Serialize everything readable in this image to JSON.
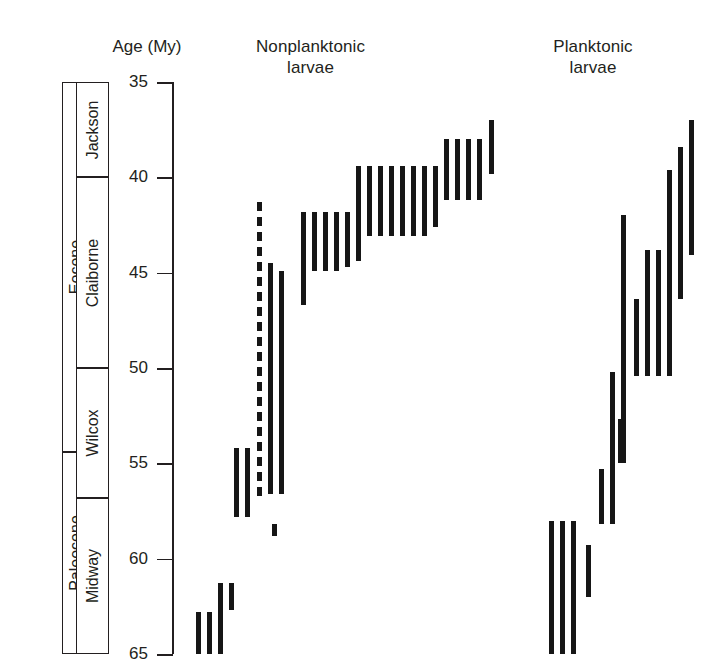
{
  "axis": {
    "title": "Age (My)",
    "unit": "My",
    "min": 35,
    "max": 65,
    "ticks": [
      35,
      40,
      45,
      50,
      55,
      60,
      65
    ],
    "tick_labels": [
      "35",
      "40",
      "45",
      "50",
      "55",
      "60",
      "65"
    ]
  },
  "headers": {
    "nonplanktonic": "Nonplanktonic\nlarvae",
    "planktonic": "Planktonic\nlarvae"
  },
  "stratigraphy": {
    "epochs": [
      {
        "name": "Eocene",
        "top_my": 35.0,
        "bottom_my": 54.4
      },
      {
        "name": "Paleocene",
        "top_my": 54.4,
        "bottom_my": 65.0
      }
    ],
    "stages": [
      {
        "name": "Jackson",
        "top_my": 35.0,
        "bottom_my": 40.0
      },
      {
        "name": "Claiborne",
        "top_my": 40.0,
        "bottom_my": 50.0
      },
      {
        "name": "Wilcox",
        "top_my": 50.0,
        "bottom_my": 56.8
      },
      {
        "name": "Midway",
        "top_my": 56.8,
        "bottom_my": 65.0
      }
    ]
  },
  "chart_data": {
    "type": "range_bar",
    "xlabel": "",
    "ylabel": "Age (My)",
    "ylim": [
      65,
      35
    ],
    "y_inverted": true,
    "grid": false,
    "legend_position": "none",
    "color": "#161616",
    "groups": [
      {
        "name": "Nonplanktonic larvae",
        "ranges": [
          {
            "index": 1,
            "top_my": 62.8,
            "bottom_my": 65.0,
            "style": "solid"
          },
          {
            "index": 2,
            "top_my": 62.8,
            "bottom_my": 65.0,
            "style": "solid"
          },
          {
            "index": 3,
            "top_my": 61.3,
            "bottom_my": 65.0,
            "style": "solid"
          },
          {
            "index": 4,
            "top_my": 61.3,
            "bottom_my": 62.7,
            "style": "solid"
          },
          {
            "index": 5,
            "top_my": 58.2,
            "bottom_my": 58.8,
            "style": "solid"
          },
          {
            "index": 6,
            "top_my": 54.2,
            "bottom_my": 57.8,
            "style": "solid"
          },
          {
            "index": 7,
            "top_my": 54.2,
            "bottom_my": 57.8,
            "style": "solid"
          },
          {
            "index": 8,
            "top_my": 41.3,
            "bottom_my": 56.8,
            "style": "dashed"
          },
          {
            "index": 9,
            "top_my": 44.5,
            "bottom_my": 56.6,
            "style": "solid"
          },
          {
            "index": 10,
            "top_my": 44.9,
            "bottom_my": 56.6,
            "style": "solid"
          },
          {
            "index": 11,
            "top_my": 41.8,
            "bottom_my": 46.7,
            "style": "solid"
          },
          {
            "index": 12,
            "top_my": 41.8,
            "bottom_my": 44.9,
            "style": "solid"
          },
          {
            "index": 13,
            "top_my": 41.8,
            "bottom_my": 44.9,
            "style": "solid"
          },
          {
            "index": 14,
            "top_my": 41.8,
            "bottom_my": 44.9,
            "style": "solid"
          },
          {
            "index": 15,
            "top_my": 41.8,
            "bottom_my": 44.7,
            "style": "solid"
          },
          {
            "index": 16,
            "top_my": 39.4,
            "bottom_my": 44.4,
            "style": "solid"
          },
          {
            "index": 17,
            "top_my": 39.4,
            "bottom_my": 43.1,
            "style": "solid"
          },
          {
            "index": 18,
            "top_my": 39.4,
            "bottom_my": 43.1,
            "style": "solid"
          },
          {
            "index": 19,
            "top_my": 39.4,
            "bottom_my": 43.1,
            "style": "solid"
          },
          {
            "index": 20,
            "top_my": 39.4,
            "bottom_my": 43.1,
            "style": "solid"
          },
          {
            "index": 21,
            "top_my": 39.4,
            "bottom_my": 43.1,
            "style": "solid"
          },
          {
            "index": 22,
            "top_my": 39.4,
            "bottom_my": 43.1,
            "style": "solid"
          },
          {
            "index": 23,
            "top_my": 39.4,
            "bottom_my": 42.6,
            "style": "solid"
          },
          {
            "index": 24,
            "top_my": 38.0,
            "bottom_my": 41.2,
            "style": "solid"
          },
          {
            "index": 25,
            "top_my": 38.0,
            "bottom_my": 41.2,
            "style": "solid"
          },
          {
            "index": 26,
            "top_my": 38.0,
            "bottom_my": 41.2,
            "style": "solid"
          },
          {
            "index": 27,
            "top_my": 38.0,
            "bottom_my": 41.2,
            "style": "solid"
          },
          {
            "index": 28,
            "top_my": 37.0,
            "bottom_my": 39.8,
            "style": "solid"
          }
        ]
      },
      {
        "name": "Planktonic larvae",
        "ranges": [
          {
            "index": 1,
            "top_my": 58.0,
            "bottom_my": 65.0,
            "style": "solid"
          },
          {
            "index": 2,
            "top_my": 58.0,
            "bottom_my": 65.0,
            "style": "solid"
          },
          {
            "index": 3,
            "top_my": 58.0,
            "bottom_my": 65.0,
            "style": "solid"
          },
          {
            "index": 4,
            "top_my": 59.3,
            "bottom_my": 62.0,
            "style": "solid"
          },
          {
            "index": 5,
            "top_my": 55.3,
            "bottom_my": 58.2,
            "style": "solid"
          },
          {
            "index": 6,
            "top_my": 50.2,
            "bottom_my": 58.2,
            "style": "solid"
          },
          {
            "index": 7,
            "top_my": 52.7,
            "bottom_my": 55.0,
            "style": "solid"
          },
          {
            "index": 8,
            "top_my": 42.0,
            "bottom_my": 55.0,
            "style": "solid"
          },
          {
            "index": 9,
            "top_my": 46.4,
            "bottom_my": 50.4,
            "style": "solid"
          },
          {
            "index": 10,
            "top_my": 43.8,
            "bottom_my": 50.4,
            "style": "solid"
          },
          {
            "index": 11,
            "top_my": 43.8,
            "bottom_my": 50.4,
            "style": "solid"
          },
          {
            "index": 12,
            "top_my": 39.6,
            "bottom_my": 50.4,
            "style": "solid"
          },
          {
            "index": 13,
            "top_my": 38.4,
            "bottom_my": 46.4,
            "style": "solid"
          },
          {
            "index": 14,
            "top_my": 37.0,
            "bottom_my": 44.1,
            "style": "solid"
          }
        ]
      }
    ]
  },
  "layout": {
    "axis_top_px": 82,
    "axis_bottom_px": 654,
    "bar_width_px": 5,
    "nonplanktonic_x": [
      196,
      207,
      218,
      229,
      272,
      234,
      245,
      257,
      268,
      279,
      301,
      312,
      323,
      334,
      345,
      356,
      367,
      378,
      389,
      400,
      411,
      422,
      433,
      444,
      455,
      466,
      477,
      489
    ],
    "planktonic_x": [
      549,
      560,
      571,
      586,
      599,
      610,
      618,
      621,
      634,
      645,
      656,
      667,
      678,
      689
    ]
  }
}
